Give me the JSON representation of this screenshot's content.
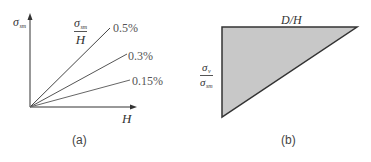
{
  "panel_a": {
    "y_axis_label": {
      "symbol": "σ",
      "subscript": "sm"
    },
    "x_axis_label": "H",
    "ratio_label": {
      "numerator_symbol": "σ",
      "numerator_subscript": "sm",
      "denominator": "H"
    },
    "lines": [
      {
        "label": "0.5%",
        "end": [
          110,
          28
        ],
        "color": "#4a4a4a"
      },
      {
        "label": "0.3%",
        "end": [
          127,
          54
        ],
        "color": "#555555"
      },
      {
        "label": "0.15%",
        "end": [
          130,
          80
        ],
        "color": "#6a6a6a"
      }
    ],
    "origin": [
      30,
      107
    ],
    "caption": "(a)"
  },
  "panel_b": {
    "top_label": "D/H",
    "side_label": {
      "numerator_symbol": "σ",
      "numerator_subscript": "v",
      "denominator_symbol": "σ",
      "denominator_subscript": "sm"
    },
    "triangle": {
      "top_left": [
        222,
        27
      ],
      "top_right": [
        357,
        27
      ],
      "bottom_left": [
        222,
        117
      ]
    },
    "fill_color": "#c8c8c8",
    "stroke_color": "#333333",
    "caption": "(b)"
  }
}
